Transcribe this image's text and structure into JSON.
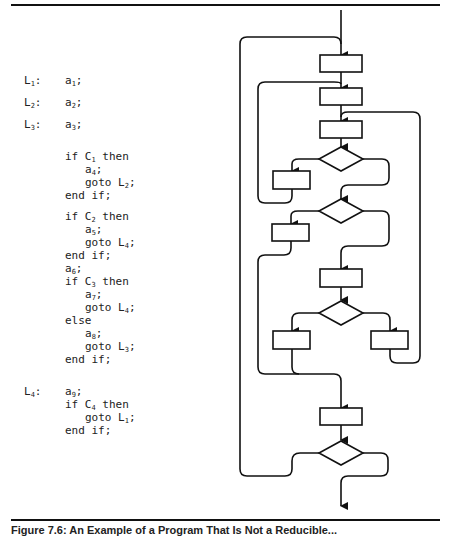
{
  "program": {
    "lines": [
      {
        "label": "L",
        "label_sub": "1",
        "colon": ":",
        "indent": 0,
        "parts": [
          [
            "a",
            "1"
          ],
          [
            ";",
            ""
          ]
        ],
        "y": 84
      },
      {
        "label": "L",
        "label_sub": "2",
        "colon": ":",
        "indent": 0,
        "parts": [
          [
            "a",
            "2"
          ],
          [
            ";",
            ""
          ]
        ],
        "y": 106
      },
      {
        "label": "L",
        "label_sub": "3",
        "colon": ":",
        "indent": 0,
        "parts": [
          [
            "a",
            "3"
          ],
          [
            ";",
            ""
          ]
        ],
        "y": 128
      },
      {
        "label": "",
        "indent": 0,
        "parts": [
          [
            "if C",
            "1"
          ],
          [
            " then",
            ""
          ]
        ],
        "y": 160
      },
      {
        "label": "",
        "indent": 1,
        "parts": [
          [
            "a",
            "4"
          ],
          [
            ";",
            ""
          ]
        ],
        "y": 173
      },
      {
        "label": "",
        "indent": 1,
        "parts": [
          [
            "goto L",
            "2"
          ],
          [
            ";",
            ""
          ]
        ],
        "y": 186
      },
      {
        "label": "",
        "indent": 0,
        "parts": [
          [
            "end if;",
            ""
          ]
        ],
        "y": 199
      },
      {
        "label": "",
        "indent": 0,
        "parts": [
          [
            "if C",
            "2"
          ],
          [
            " then",
            ""
          ]
        ],
        "y": 220
      },
      {
        "label": "",
        "indent": 1,
        "parts": [
          [
            "a",
            "5"
          ],
          [
            ";",
            ""
          ]
        ],
        "y": 233
      },
      {
        "label": "",
        "indent": 1,
        "parts": [
          [
            "goto L",
            "4"
          ],
          [
            ";",
            ""
          ]
        ],
        "y": 246
      },
      {
        "label": "",
        "indent": 0,
        "parts": [
          [
            "end if;",
            ""
          ]
        ],
        "y": 259
      },
      {
        "label": "",
        "indent": 0,
        "parts": [
          [
            "a",
            "6"
          ],
          [
            ";",
            ""
          ]
        ],
        "y": 272
      },
      {
        "label": "",
        "indent": 0,
        "parts": [
          [
            "if C",
            "3"
          ],
          [
            " then",
            ""
          ]
        ],
        "y": 285
      },
      {
        "label": "",
        "indent": 1,
        "parts": [
          [
            "a",
            "7"
          ],
          [
            ";",
            ""
          ]
        ],
        "y": 298
      },
      {
        "label": "",
        "indent": 1,
        "parts": [
          [
            "goto L",
            "4"
          ],
          [
            ";",
            ""
          ]
        ],
        "y": 311
      },
      {
        "label": "",
        "indent": 0,
        "parts": [
          [
            "else",
            ""
          ]
        ],
        "y": 324
      },
      {
        "label": "",
        "indent": 1,
        "parts": [
          [
            "a",
            "8"
          ],
          [
            ";",
            ""
          ]
        ],
        "y": 337
      },
      {
        "label": "",
        "indent": 1,
        "parts": [
          [
            "goto L",
            "3"
          ],
          [
            ";",
            ""
          ]
        ],
        "y": 350
      },
      {
        "label": "",
        "indent": 0,
        "parts": [
          [
            "end if;",
            ""
          ]
        ],
        "y": 363
      },
      {
        "label": "L",
        "label_sub": "4",
        "colon": ":",
        "indent": 0,
        "parts": [
          [
            "a",
            "9"
          ],
          [
            ";",
            ""
          ]
        ],
        "y": 395
      },
      {
        "label": "",
        "indent": 0,
        "parts": [
          [
            "if C",
            "4"
          ],
          [
            " then",
            ""
          ]
        ],
        "y": 408
      },
      {
        "label": "",
        "indent": 1,
        "parts": [
          [
            "goto L",
            "1"
          ],
          [
            ";",
            ""
          ]
        ],
        "y": 421
      },
      {
        "label": "",
        "indent": 0,
        "parts": [
          [
            "end if;",
            ""
          ]
        ],
        "y": 434
      }
    ]
  },
  "flowchart": {
    "stroke": "#111111",
    "boxes": [
      {
        "id": "a1",
        "x": 320,
        "y": 55,
        "w": 42,
        "h": 17
      },
      {
        "id": "a2",
        "x": 320,
        "y": 88,
        "w": 42,
        "h": 17
      },
      {
        "id": "a3",
        "x": 320,
        "y": 121,
        "w": 42,
        "h": 17
      },
      {
        "id": "a4",
        "x": 273,
        "y": 171,
        "w": 37,
        "h": 18
      },
      {
        "id": "a5",
        "x": 272,
        "y": 224,
        "w": 37,
        "h": 17
      },
      {
        "id": "a6",
        "x": 320,
        "y": 269,
        "w": 42,
        "h": 18
      },
      {
        "id": "a7",
        "x": 273,
        "y": 331,
        "w": 37,
        "h": 18
      },
      {
        "id": "a8",
        "x": 371,
        "y": 331,
        "w": 37,
        "h": 18
      },
      {
        "id": "a9",
        "x": 320,
        "y": 408,
        "w": 42,
        "h": 17
      }
    ],
    "diamonds": [
      {
        "id": "C1",
        "cx": 341,
        "cy": 159,
        "hw": 22,
        "hh": 12
      },
      {
        "id": "C2",
        "cx": 341,
        "cy": 211,
        "hw": 22,
        "hh": 12
      },
      {
        "id": "C3",
        "cx": 341,
        "cy": 313,
        "hw": 22,
        "hh": 12
      },
      {
        "id": "C4",
        "cx": 341,
        "cy": 453,
        "hw": 22,
        "hh": 12
      }
    ]
  },
  "caption": "Figure 7.6: An Example of a Program That Is Not a Reducible..."
}
